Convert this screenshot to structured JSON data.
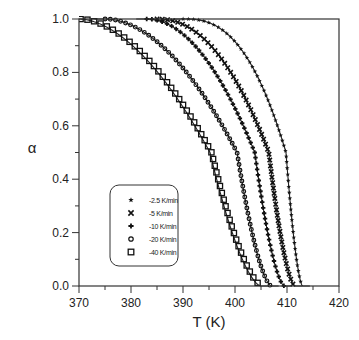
{
  "chart_data": {
    "type": "scatter",
    "title": "",
    "xlabel": "T (K)",
    "ylabel": "α",
    "xlim": [
      370,
      420
    ],
    "ylim": [
      0.0,
      1.0
    ],
    "xticks": [
      370,
      380,
      390,
      400,
      410,
      420
    ],
    "yticks": [
      0.0,
      0.2,
      0.4,
      0.6,
      0.8,
      1.0
    ],
    "xtick_labels": [
      "370",
      "380",
      "390",
      "400",
      "410",
      "420"
    ],
    "ytick_labels": [
      "0.0",
      "0.2",
      "0.4",
      "0.6",
      "0.8",
      "1.0"
    ],
    "grid": false,
    "legend_position": "lower-left inside",
    "series": [
      {
        "name": "-2.5 K/min",
        "marker": "star",
        "t_start": 390.0,
        "t_mid": 409.8,
        "t_end": 413.0,
        "shape": 2.6,
        "points": [
          [
            392,
            1.0
          ],
          [
            400,
            0.99
          ],
          [
            404,
            0.95
          ],
          [
            406,
            0.88
          ],
          [
            408,
            0.72
          ],
          [
            409,
            0.6
          ],
          [
            410,
            0.47
          ],
          [
            411,
            0.3
          ],
          [
            412,
            0.1
          ],
          [
            413,
            0.0
          ]
        ]
      },
      {
        "name": "-5 K/min",
        "marker": "cross",
        "t_start": 385.0,
        "t_mid": 406.5,
        "t_end": 411.5,
        "shape": 2.2,
        "points": [
          [
            386,
            1.0
          ],
          [
            395,
            0.98
          ],
          [
            400,
            0.92
          ],
          [
            403,
            0.8
          ],
          [
            405,
            0.65
          ],
          [
            406.5,
            0.5
          ],
          [
            408,
            0.3
          ],
          [
            409.5,
            0.12
          ],
          [
            411,
            0.01
          ]
        ]
      },
      {
        "name": "-10 K/min",
        "marker": "plus",
        "t_start": 383.0,
        "t_mid": 403.8,
        "t_end": 409.5,
        "shape": 2.0,
        "points": [
          [
            384,
            1.0
          ],
          [
            392,
            0.97
          ],
          [
            397,
            0.9
          ],
          [
            400,
            0.8
          ],
          [
            402,
            0.66
          ],
          [
            403.8,
            0.5
          ],
          [
            405.5,
            0.3
          ],
          [
            407,
            0.12
          ],
          [
            409,
            0.01
          ]
        ]
      },
      {
        "name": "-20 K/min",
        "marker": "diamond",
        "t_start": 375.0,
        "t_mid": 400.4,
        "t_end": 407.0,
        "shape": 1.9,
        "points": [
          [
            376,
            1.0
          ],
          [
            385,
            0.97
          ],
          [
            391,
            0.89
          ],
          [
            395,
            0.78
          ],
          [
            398,
            0.64
          ],
          [
            400.4,
            0.5
          ],
          [
            402,
            0.33
          ],
          [
            403.5,
            0.15
          ],
          [
            405,
            0.03
          ],
          [
            407,
            0.0
          ]
        ]
      },
      {
        "name": "-40 K/min",
        "marker": "square",
        "t_start": 370.0,
        "t_mid": 395.2,
        "t_end": 405.0,
        "shape": 1.8,
        "points": [
          [
            371,
            1.0
          ],
          [
            377,
            0.98
          ],
          [
            382,
            0.92
          ],
          [
            386,
            0.84
          ],
          [
            390,
            0.72
          ],
          [
            393,
            0.6
          ],
          [
            395.2,
            0.5
          ],
          [
            397,
            0.35
          ],
          [
            399,
            0.18
          ],
          [
            400.5,
            0.07
          ],
          [
            402,
            0.01
          ],
          [
            405,
            0.0
          ]
        ]
      }
    ]
  },
  "legend": {
    "items": [
      {
        "label": "-2.5 K/min",
        "marker": "star"
      },
      {
        "label": "-5 K/min",
        "marker": "cross"
      },
      {
        "label": "-10 K/min",
        "marker": "plus"
      },
      {
        "label": "-20 K/min",
        "marker": "diamond"
      },
      {
        "label": "-40 K/min",
        "marker": "square"
      }
    ]
  },
  "colors": {
    "axis": "#333333",
    "series": "#111111",
    "fit_line": "#222222",
    "background": "#ffffff"
  }
}
